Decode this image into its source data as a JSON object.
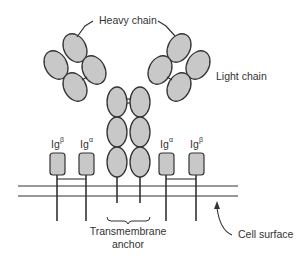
{
  "diagram": {
    "labels": {
      "heavy_chain": "Heavy chain",
      "light_chain": "Light chain",
      "transmembrane_line1": "Transmembrane",
      "transmembrane_line2": "anchor",
      "cell_surface": "Cell surface"
    },
    "accessory_proteins": [
      {
        "base": "Ig",
        "sup": "β"
      },
      {
        "base": "Ig",
        "sup": "α"
      },
      {
        "base": "Ig",
        "sup": "α"
      },
      {
        "base": "Ig",
        "sup": "β"
      }
    ],
    "colors": {
      "domain_fill": "#c8c8c8",
      "stroke": "#333333",
      "background": "#ffffff"
    }
  }
}
